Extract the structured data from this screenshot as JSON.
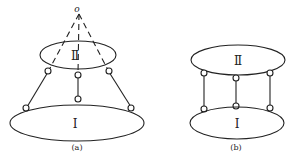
{
  "figure": {
    "apex_label": "o",
    "panel_a": {
      "caption": "(a)",
      "upper_body_label": "Ⅱ",
      "lower_body_label": "Ⅰ"
    },
    "panel_b": {
      "caption": "(b)",
      "upper_body_label": "Ⅱ",
      "lower_body_label": "Ⅰ"
    }
  }
}
